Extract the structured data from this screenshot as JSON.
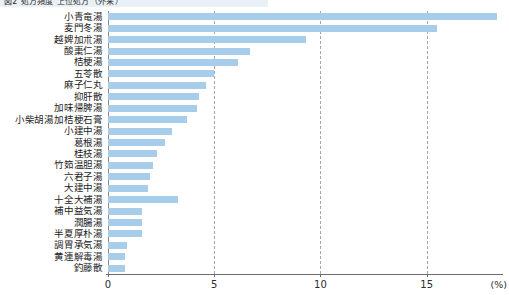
{
  "header": {
    "clipped_text": "図2 処方頻度 上位処方（外来）"
  },
  "chart_data": {
    "type": "bar",
    "orientation": "horizontal",
    "title": "",
    "subtitle": "",
    "xlabel": "",
    "ylabel": "",
    "xunit": "(%)",
    "xlim": [
      0,
      18.5
    ],
    "xticks": [
      0,
      5,
      10,
      15
    ],
    "xtick_labels": [
      "0",
      "5",
      "10",
      "15"
    ],
    "grid": "vertical-dashed",
    "legend": "none",
    "bar_color": "#a8cdea",
    "categories": [
      "小青竜湯",
      "麦門冬湯",
      "越婢加朮湯",
      "酸棗仁湯",
      "桔梗湯",
      "五苓散",
      "麻子仁丸",
      "抑肝散",
      "加味帰脾湯",
      "小柴胡湯加桔梗石膏",
      "小建中湯",
      "葛根湯",
      "桂枝湯",
      "竹筎温胆湯",
      "六君子湯",
      "大建中湯",
      "十全大補湯",
      "補中益気湯",
      "潤腸湯",
      "半夏厚朴湯",
      "調胃承気湯",
      "黄連解毒湯",
      "釣藤散"
    ],
    "values": [
      18.3,
      15.5,
      9.3,
      6.7,
      6.1,
      5.0,
      4.6,
      4.3,
      4.2,
      3.7,
      3.0,
      2.7,
      2.3,
      2.1,
      2.0,
      1.9,
      3.3,
      1.6,
      1.6,
      1.6,
      0.9,
      0.8,
      0.8
    ]
  }
}
